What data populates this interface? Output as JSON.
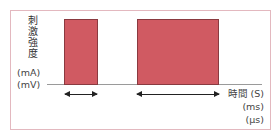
{
  "diagram": {
    "y_label_chars": [
      "刺",
      "激",
      "強",
      "度"
    ],
    "y_units": [
      "(mA)",
      "(mV)"
    ],
    "x_label": "時間 (S)",
    "x_units": [
      "(ms)",
      "(μs)"
    ],
    "pulses": [
      {
        "name": "pulse-1",
        "left": 64,
        "width": 34
      },
      {
        "name": "pulse-2",
        "left": 137,
        "width": 82
      }
    ],
    "colors": {
      "pulse_fill": "#d05a62",
      "pulse_border": "#8a3a40",
      "frame": "#e3b8bf",
      "baseline": "#9a9a9a"
    }
  }
}
